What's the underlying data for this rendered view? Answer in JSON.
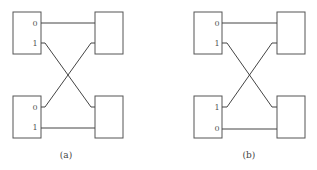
{
  "panels": [
    {
      "caption": "(a)",
      "top_left_ports": [
        "0",
        "1"
      ],
      "bottom_left_ports": [
        "0",
        "1"
      ],
      "connections": [
        {
          "from": "top-left.0",
          "to": "top-right",
          "type": "straight"
        },
        {
          "from": "top-left.1",
          "to": "bottom-right",
          "type": "cross"
        },
        {
          "from": "bottom-left.0",
          "to": "top-right",
          "type": "cross"
        },
        {
          "from": "bottom-left.1",
          "to": "bottom-right",
          "type": "straight"
        }
      ]
    },
    {
      "caption": "(b)",
      "top_left_ports": [
        "0",
        "1"
      ],
      "bottom_left_ports": [
        "1",
        "0"
      ],
      "connections": [
        {
          "from": "top-left.0",
          "to": "top-right",
          "type": "straight"
        },
        {
          "from": "top-left.1",
          "to": "bottom-right",
          "type": "cross"
        },
        {
          "from": "bottom-left.1",
          "to": "top-right",
          "type": "cross"
        },
        {
          "from": "bottom-left.0",
          "to": "bottom-right",
          "type": "straight"
        }
      ]
    }
  ]
}
